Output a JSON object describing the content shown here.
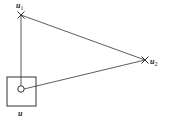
{
  "diagram": {
    "colors": {
      "stroke": "#333333",
      "background": "#ffffff"
    },
    "nodes": [
      {
        "id": "u",
        "label": "u",
        "shape": "square-with-circle"
      },
      {
        "id": "u1",
        "label": "u",
        "subscript": "1",
        "shape": "cross"
      },
      {
        "id": "u2",
        "label": "u",
        "subscript": "2",
        "shape": "cross"
      }
    ],
    "edges": [
      {
        "from": "u",
        "to": "u1"
      },
      {
        "from": "u1",
        "to": "u2"
      },
      {
        "from": "u",
        "to": "u2"
      }
    ]
  }
}
